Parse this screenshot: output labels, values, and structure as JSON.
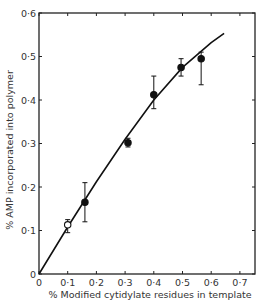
{
  "chart_data": {
    "type": "scatter",
    "title": "",
    "xlabel": "% Modified cytidylate residues in template",
    "ylabel": "% AMP incorporated into polymer",
    "xlim": [
      0,
      0.75
    ],
    "ylim": [
      0,
      0.6
    ],
    "grid": false,
    "legend": null,
    "x_ticks": [
      0,
      0.1,
      0.2,
      0.3,
      0.4,
      0.5,
      0.6,
      0.7
    ],
    "x_tick_labels": [
      "0",
      "0·1",
      "0·2",
      "0·3",
      "0·4",
      "0·5",
      "0·6",
      "0·7"
    ],
    "y_ticks": [
      0,
      0.1,
      0.2,
      0.3,
      0.4,
      0.5,
      0.6
    ],
    "y_tick_labels": [
      "0",
      "0·1",
      "0·2",
      "0·3",
      "0·4",
      "0·5",
      "0·6"
    ],
    "series": [
      {
        "name": "measured",
        "points": [
          {
            "x": 0.1,
            "y": 0.113,
            "err_low": 0.095,
            "err_high": 0.125,
            "marker": "open-circle"
          },
          {
            "x": 0.16,
            "y": 0.165,
            "err_low": 0.12,
            "err_high": 0.21,
            "marker": "filled-circle"
          },
          {
            "x": 0.31,
            "y": 0.302,
            "err_low": 0.292,
            "err_high": 0.312,
            "marker": "filled-circle"
          },
          {
            "x": 0.4,
            "y": 0.412,
            "err_low": 0.38,
            "err_high": 0.455,
            "marker": "filled-circle"
          },
          {
            "x": 0.495,
            "y": 0.475,
            "err_low": 0.455,
            "err_high": 0.495,
            "marker": "filled-circle"
          },
          {
            "x": 0.565,
            "y": 0.495,
            "err_low": 0.435,
            "err_high": 0.51,
            "marker": "filled-circle"
          }
        ]
      },
      {
        "name": "fitted-curve",
        "type": "line",
        "x": [
          0,
          0.1,
          0.2,
          0.3,
          0.4,
          0.5,
          0.6,
          0.645
        ],
        "y": [
          0,
          0.108,
          0.212,
          0.31,
          0.4,
          0.475,
          0.532,
          0.553
        ]
      }
    ]
  }
}
